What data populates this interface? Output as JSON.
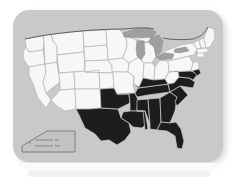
{
  "figure": {
    "card": {
      "background_color": "#c9c9c9",
      "border_radius_px": 16,
      "shadow_color": "#d7d7d7"
    }
  },
  "map": {
    "region": "Continental United States",
    "projection_note": "contiguous 48 states, mid-19th-century boundaries",
    "colors": {
      "free_state_fill": "#f7f7f7",
      "free_state_border": "#b5b5b5",
      "slave_state_fill": "#1d1d1d",
      "slave_state_border": "#cfcfcf",
      "great_lakes_fill": "#9f9f9f",
      "national_outline": "#555555",
      "ocean_background": "#c9c9c9"
    },
    "shaded_states": [
      "Texas",
      "Indian Territory",
      "Arkansas",
      "Louisiana",
      "Mississippi",
      "Alabama",
      "Tennessee",
      "Kentucky",
      "Georgia",
      "Florida",
      "South Carolina",
      "North Carolina",
      "Virginia",
      "Maryland",
      "Delaware"
    ],
    "unshaded_states": [
      "Washington",
      "Oregon",
      "Idaho",
      "Montana",
      "Wyoming",
      "North Dakota",
      "South Dakota",
      "Nebraska",
      "Kansas",
      "Colorado",
      "Utah",
      "Nevada",
      "California",
      "Arizona",
      "New Mexico",
      "Minnesota",
      "Iowa",
      "Missouri",
      "Wisconsin",
      "Illinois",
      "Michigan",
      "Indiana",
      "Ohio",
      "Pennsylvania",
      "New York",
      "New Jersey",
      "Vermont",
      "New Hampshire",
      "Maine",
      "Massachusetts",
      "Connecticut",
      "Rhode Island",
      "West Virginia"
    ],
    "water_bodies": [
      "Lake Superior",
      "Lake Michigan",
      "Lake Huron",
      "Lake Erie",
      "Lake Ontario"
    ]
  },
  "legend": {
    "position": "bottom-left",
    "scale_label": "0",
    "scale_unit": "mi",
    "scale_secondary": "km"
  }
}
